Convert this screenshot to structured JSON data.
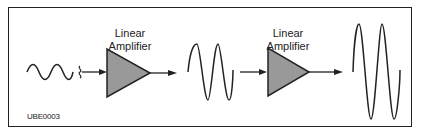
{
  "diagram": {
    "amplifiers": [
      {
        "label_line1": "Linear",
        "label_line2": "Amplifier"
      },
      {
        "label_line1": "Linear",
        "label_line2": "Amplifier"
      }
    ],
    "signals": [
      {
        "name": "input",
        "amplitude": "small",
        "cycles": 2.5
      },
      {
        "name": "intermediate",
        "amplitude": "medium",
        "cycles": 2
      },
      {
        "name": "output",
        "amplitude": "large",
        "cycles": 2
      }
    ],
    "figure_code": "UBE0003",
    "colors": {
      "amplifier_fill": "#999999",
      "stroke": "#222222"
    }
  }
}
